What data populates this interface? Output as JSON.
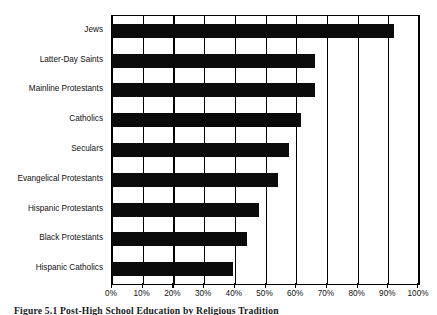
{
  "chart_data": {
    "type": "bar",
    "orientation": "horizontal",
    "title": "",
    "xlabel": "",
    "ylabel": "",
    "categories": [
      "Jews",
      "Latter-Day Saints",
      "Mainline Protestants",
      "Catholics",
      "Seculars",
      "Evangelical Protestants",
      "Hispanic Protestants",
      "Black Protestants",
      "Hispanic Catholics"
    ],
    "values": [
      92,
      66,
      66,
      61.5,
      57.5,
      54,
      48,
      44,
      39.5
    ],
    "xlim": [
      0,
      100
    ],
    "xticks": [
      0,
      10,
      20,
      30,
      40,
      50,
      60,
      70,
      80,
      90,
      100
    ],
    "xticklabels": [
      "0%",
      "10%",
      "20%",
      "30%",
      "40%",
      "50%",
      "60%",
      "70%",
      "80%",
      "90%",
      "100%"
    ],
    "grid": true,
    "grid_axis": "x",
    "legend": false,
    "bar_color": "#0b0b0b",
    "axis_color": "#000000",
    "background_color": "#ffffff"
  },
  "caption": {
    "text": "Figure 5.1   Post-High School Education by Religious Tradition"
  }
}
